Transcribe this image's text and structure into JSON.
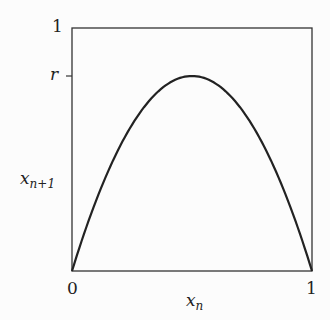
{
  "diagram": {
    "y_axis": {
      "label": "x",
      "label_sub": "n+1",
      "ticks": [
        "1",
        "r"
      ]
    },
    "x_axis": {
      "label": "x",
      "label_sub": "n",
      "ticks": [
        "0",
        "1"
      ]
    },
    "curve": "x_{n+1} = 4 r x_n (1 - x_n)",
    "colors": {
      "line": "#222222",
      "background": "#fcfcfc"
    }
  }
}
